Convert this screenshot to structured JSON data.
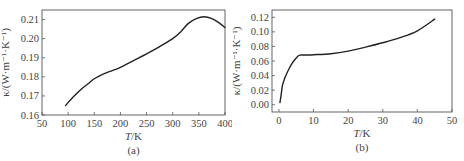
{
  "chart_data": [
    {
      "id": "a",
      "type": "line",
      "caption": "(a)",
      "xlabel_italic": "T",
      "xlabel_unit": "/K",
      "ylabel": "κ/(W·m⁻¹·K⁻¹)",
      "xlim": [
        50,
        400
      ],
      "ylim": [
        0.16,
        0.215
      ],
      "xticks": [
        50,
        100,
        150,
        200,
        250,
        300,
        350,
        400
      ],
      "xtick_labels": [
        "50",
        "100",
        "150",
        "200",
        "250",
        "300",
        "350",
        "400"
      ],
      "yticks": [
        0.16,
        0.17,
        0.18,
        0.19,
        0.2,
        0.21
      ],
      "ytick_labels": [
        "0.16",
        "0.17",
        "0.18",
        "0.19",
        "0.20",
        "0.21"
      ],
      "grid": false,
      "series": [
        {
          "name": "kappa",
          "x": [
            95,
            110,
            125,
            140,
            150,
            165,
            180,
            200,
            225,
            250,
            275,
            300,
            315,
            330,
            345,
            360,
            375,
            390,
            400
          ],
          "y": [
            0.165,
            0.1695,
            0.1735,
            0.1768,
            0.179,
            0.1812,
            0.1828,
            0.185,
            0.1885,
            0.192,
            0.1958,
            0.2,
            0.2035,
            0.208,
            0.2105,
            0.2115,
            0.2105,
            0.208,
            0.2058
          ]
        }
      ]
    },
    {
      "id": "b",
      "type": "line",
      "caption": "(b)",
      "xlabel_italic": "T",
      "xlabel_unit": "/K",
      "ylabel": "κ/(W·m⁻¹·K⁻¹)",
      "xlim": [
        -2,
        50
      ],
      "ylim": [
        -0.01,
        0.13
      ],
      "xticks": [
        0,
        10,
        20,
        30,
        40,
        50
      ],
      "xtick_labels": [
        "0",
        "10",
        "20",
        "30",
        "40",
        "50"
      ],
      "yticks": [
        0.0,
        0.02,
        0.04,
        0.06,
        0.08,
        0.1,
        0.12
      ],
      "ytick_labels": [
        "0.00",
        "0.02",
        "0.04",
        "0.06",
        "0.08",
        "0.10",
        "0.12"
      ],
      "grid": false,
      "series": [
        {
          "name": "kappa",
          "x": [
            0.3,
            0.6,
            1.0,
            1.5,
            2.0,
            3.0,
            4.0,
            5.0,
            6.0,
            8.0,
            10,
            15,
            20,
            25,
            30,
            35,
            40,
            45
          ],
          "y": [
            0.003,
            0.012,
            0.026,
            0.034,
            0.04,
            0.05,
            0.058,
            0.064,
            0.068,
            0.0682,
            0.0686,
            0.07,
            0.0735,
            0.079,
            0.085,
            0.092,
            0.1015,
            0.1175
          ]
        }
      ]
    }
  ],
  "panels": {
    "a": {
      "caption": "(a)",
      "xlabel_italic": "T",
      "xlabel_unit": "/K",
      "ylabel": "κ/(W·m⁻¹·K⁻¹)"
    },
    "b": {
      "caption": "(b)",
      "xlabel_italic": "T",
      "xlabel_unit": "/K",
      "ylabel": "κ/(W·m⁻¹·K⁻¹)"
    }
  }
}
